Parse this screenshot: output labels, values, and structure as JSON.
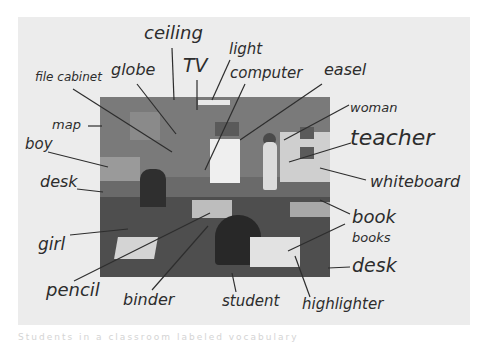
{
  "worksheet": {
    "type": "labeled classroom photo",
    "photo_subject": "classroom",
    "labels": [
      {
        "id": "ceiling",
        "text": "ceiling",
        "x": 144,
        "y": 24,
        "size": 18
      },
      {
        "id": "light",
        "text": "light",
        "x": 229,
        "y": 42,
        "size": 15
      },
      {
        "id": "tv",
        "text": "TV",
        "x": 183,
        "y": 56,
        "size": 19
      },
      {
        "id": "globe",
        "text": "globe",
        "x": 111,
        "y": 62,
        "size": 16
      },
      {
        "id": "file-cabinet",
        "text": "file cabinet",
        "x": 35,
        "y": 71,
        "size": 12
      },
      {
        "id": "computer",
        "text": "computer",
        "x": 230,
        "y": 66,
        "size": 15
      },
      {
        "id": "easel",
        "text": "easel",
        "x": 324,
        "y": 62,
        "size": 16
      },
      {
        "id": "woman",
        "text": "woman",
        "x": 350,
        "y": 101,
        "size": 13
      },
      {
        "id": "teacher",
        "text": "teacher",
        "x": 350,
        "y": 127,
        "size": 22
      },
      {
        "id": "map",
        "text": "map",
        "x": 52,
        "y": 118,
        "size": 13
      },
      {
        "id": "boy",
        "text": "boy",
        "x": 25,
        "y": 137,
        "size": 15
      },
      {
        "id": "desk-left",
        "text": "desk",
        "x": 40,
        "y": 174,
        "size": 16
      },
      {
        "id": "whiteboard",
        "text": "whiteboard",
        "x": 370,
        "y": 174,
        "size": 16
      },
      {
        "id": "book",
        "text": "book",
        "x": 352,
        "y": 208,
        "size": 18
      },
      {
        "id": "books",
        "text": "books",
        "x": 352,
        "y": 231,
        "size": 13
      },
      {
        "id": "girl",
        "text": "girl",
        "x": 38,
        "y": 236,
        "size": 17
      },
      {
        "id": "desk-right",
        "text": "desk",
        "x": 352,
        "y": 256,
        "size": 19
      },
      {
        "id": "pencil",
        "text": "pencil",
        "x": 46,
        "y": 281,
        "size": 18
      },
      {
        "id": "binder",
        "text": "binder",
        "x": 123,
        "y": 292,
        "size": 16
      },
      {
        "id": "student",
        "text": "student",
        "x": 222,
        "y": 294,
        "size": 15
      },
      {
        "id": "highlighter",
        "text": "highlighter",
        "x": 302,
        "y": 297,
        "size": 15
      }
    ],
    "leader_lines": [
      {
        "for": "ceiling",
        "x1": 172,
        "y1": 48,
        "x2": 174,
        "y2": 100
      },
      {
        "for": "tv",
        "x1": 197,
        "y1": 80,
        "x2": 197,
        "y2": 110
      },
      {
        "for": "light",
        "x1": 230,
        "y1": 60,
        "x2": 212,
        "y2": 100
      },
      {
        "for": "globe",
        "x1": 137,
        "y1": 84,
        "x2": 176,
        "y2": 134
      },
      {
        "for": "file-cabinet",
        "x1": 73,
        "y1": 89,
        "x2": 172,
        "y2": 152
      },
      {
        "for": "computer",
        "x1": 245,
        "y1": 84,
        "x2": 205,
        "y2": 170
      },
      {
        "for": "easel",
        "x1": 322,
        "y1": 84,
        "x2": 240,
        "y2": 140
      },
      {
        "for": "woman",
        "x1": 349,
        "y1": 105,
        "x2": 284,
        "y2": 140
      },
      {
        "for": "teacher",
        "x1": 351,
        "y1": 143,
        "x2": 289,
        "y2": 162
      },
      {
        "for": "map",
        "x1": 88,
        "y1": 126,
        "x2": 102,
        "y2": 126
      },
      {
        "for": "boy",
        "x1": 48,
        "y1": 152,
        "x2": 108,
        "y2": 167
      },
      {
        "for": "desk-left",
        "x1": 77,
        "y1": 189,
        "x2": 103,
        "y2": 192
      },
      {
        "for": "whiteboard",
        "x1": 366,
        "y1": 180,
        "x2": 320,
        "y2": 168
      },
      {
        "for": "book",
        "x1": 350,
        "y1": 214,
        "x2": 320,
        "y2": 200
      },
      {
        "for": "books",
        "x1": 345,
        "y1": 224,
        "x2": 288,
        "y2": 251
      },
      {
        "for": "girl",
        "x1": 70,
        "y1": 235,
        "x2": 128,
        "y2": 229
      },
      {
        "for": "desk-right",
        "x1": 350,
        "y1": 267,
        "x2": 328,
        "y2": 268
      },
      {
        "for": "pencil",
        "x1": 74,
        "y1": 281,
        "x2": 210,
        "y2": 213
      },
      {
        "for": "binder",
        "x1": 152,
        "y1": 290,
        "x2": 208,
        "y2": 226
      },
      {
        "for": "student",
        "x1": 236,
        "y1": 292,
        "x2": 232,
        "y2": 273
      },
      {
        "for": "highlighter",
        "x1": 310,
        "y1": 297,
        "x2": 295,
        "y2": 256
      }
    ]
  },
  "caption": "Students in a classroom labeled vocabulary",
  "colors": {
    "ink": "#2d2d2d",
    "paper": "#ececec",
    "background": "#ffffff",
    "photo": "#6a6a6a"
  }
}
